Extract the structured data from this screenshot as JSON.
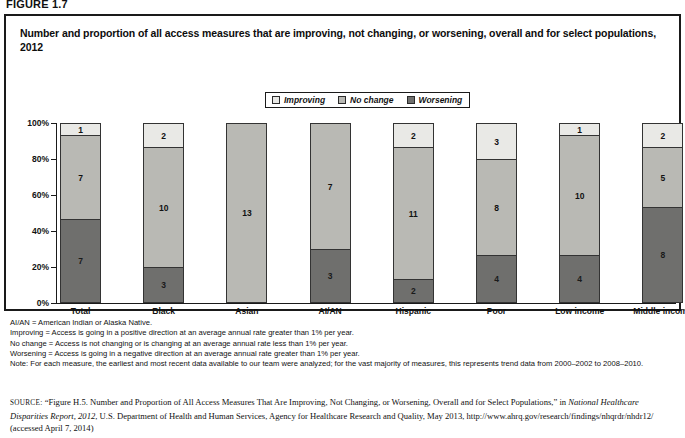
{
  "figure": {
    "label": "FIGURE 1.7",
    "title": "Number and proportion of all access measures that are improving, not changing, or worsening, overall and for select populations, 2012"
  },
  "colors": {
    "improving": "#e9e9e6",
    "no_change": "#b9b9b4",
    "worsening": "#6f6f6d",
    "outline": "#333333",
    "axis": "#1a1a1a"
  },
  "legend": {
    "items": [
      {
        "label": "Improving",
        "swatch": "#e9e9e6",
        "icon": "legend-swatch-improving"
      },
      {
        "label": "No change",
        "swatch": "#b9b9b4",
        "icon": "legend-swatch-no-change"
      },
      {
        "label": "Worsening",
        "swatch": "#6f6f6d",
        "icon": "legend-swatch-worsening"
      }
    ]
  },
  "chart_data": {
    "type": "bar",
    "subtype": "stacked-100-percent",
    "title": "Number and proportion of all access measures that are improving, not changing, or worsening, overall and for select populations, 2012",
    "xlabel": "",
    "ylabel": "",
    "ylim": [
      0,
      100
    ],
    "ytick_labels": [
      "0%",
      "20%",
      "40%",
      "60%",
      "80%",
      "100%"
    ],
    "ytick_values": [
      0,
      20,
      40,
      60,
      80,
      100
    ],
    "grid": false,
    "legend_position": "top-center",
    "categories": [
      "Total",
      "Black",
      "Asian",
      "AI/AN",
      "Hispanic",
      "Poor",
      "Low income",
      "Middle income"
    ],
    "series": [
      {
        "name": "Worsening",
        "values": [
          7,
          3,
          0,
          3,
          2,
          4,
          4,
          8
        ]
      },
      {
        "name": "No change",
        "values": [
          7,
          10,
          13,
          7,
          11,
          8,
          10,
          5
        ]
      },
      {
        "name": "Improving",
        "values": [
          1,
          2,
          0,
          0,
          2,
          3,
          1,
          2
        ]
      }
    ],
    "totals": [
      15,
      15,
      13,
      10,
      15,
      15,
      15,
      15
    ],
    "percent_series": [
      {
        "name": "Worsening",
        "values": [
          46.7,
          20.0,
          0,
          30.0,
          13.3,
          26.7,
          26.7,
          53.3
        ]
      },
      {
        "name": "No change",
        "values": [
          46.7,
          66.7,
          100.0,
          70.0,
          73.3,
          53.3,
          66.7,
          33.3
        ]
      },
      {
        "name": "Improving",
        "values": [
          6.7,
          13.3,
          0,
          0,
          13.3,
          20.0,
          6.7,
          13.3
        ]
      }
    ]
  },
  "notes": [
    "AI/AN = American Indian or Alaska Native.",
    "Improving = Access is going in a positive direction at an average annual rate greater than 1% per year.",
    "No change = Access is not changing or is changing at an average annual rate less than 1% per year.",
    "Worsening = Access is going in a negative direction at an average annual rate greater than 1% per year.",
    "Note: For each measure, the earliest and most recent data available to our team were analyzed; for the vast majority of measures, this represents trend data from 2000–2002 to 2008–2010."
  ],
  "source": {
    "prefix": "SOURCE:",
    "part1": "“Figure H.5. Number and Proportion of All Access Measures That Are Improving, Not Changing, or Worsening, Overall and for Select Populations,” in ",
    "italic": "National Healthcare Disparities Report, 2012",
    "part2": ", U.S. Department of Health and Human Services, Agency for Healthcare Research and Quality, May 2013, http://www.ahrq.gov/research/findings/nhqrdr/nhdr12/ (accessed April 7, 2014)"
  }
}
